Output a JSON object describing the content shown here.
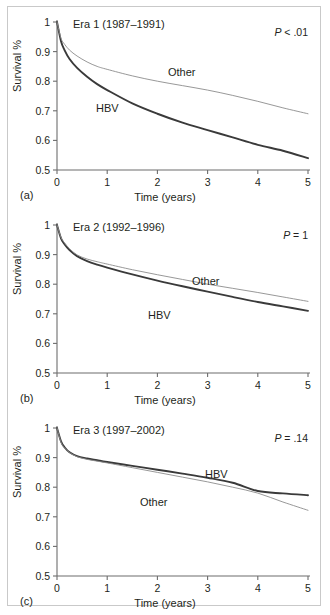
{
  "figure": {
    "panels": [
      {
        "letter": "(a)",
        "title": "Era 1 (1987–1991)",
        "pvalue_p": "P",
        "pvalue_rest": " < .01",
        "hbv_label": "HBV",
        "other_label": "Other"
      },
      {
        "letter": "(b)",
        "title": "Era 2 (1992–1996)",
        "pvalue_p": "P",
        "pvalue_rest": " = 1",
        "hbv_label": "HBV",
        "other_label": "Other"
      },
      {
        "letter": "(c)",
        "title": "Era 3 (1997–2002)",
        "pvalue_p": "P",
        "pvalue_rest": " = .14",
        "hbv_label": "HBV",
        "other_label": "Other"
      }
    ],
    "axis": {
      "xlabel": "Time (years)",
      "ylabel": "Survival %",
      "xticks": [
        "0",
        "1",
        "2",
        "3",
        "4",
        "5"
      ],
      "yticks": [
        "1",
        "0.9",
        "0.8",
        "0.7",
        "0.6",
        "0.5"
      ]
    },
    "colors": {
      "hbv": "#3a3a3a",
      "other": "#8c8c8c",
      "axis": "#6d6d6d",
      "text": "#231f20",
      "frame": "#c9c9c9",
      "background": "#ffffff"
    }
  },
  "chart_data": [
    {
      "type": "line",
      "title": "Era 1 (1987–1991)",
      "panel": "(a)",
      "annotations": [
        "P < .01"
      ],
      "xlabel": "Time (years)",
      "ylabel": "Survival %",
      "xlim": [
        0,
        5
      ],
      "ylim": [
        0.5,
        1.0
      ],
      "xticks": [
        0,
        1,
        2,
        3,
        4,
        5
      ],
      "yticks": [
        0.5,
        0.6,
        0.7,
        0.8,
        0.9,
        1.0
      ],
      "grid": false,
      "legend": "inline-curve-labels",
      "x": [
        0,
        0.08,
        0.15,
        0.25,
        0.4,
        0.6,
        0.8,
        1.0,
        1.5,
        2.0,
        2.5,
        3.0,
        3.5,
        4.0,
        4.5,
        5.0
      ],
      "series": [
        {
          "name": "HBV",
          "style": "bold",
          "values": [
            1.0,
            0.935,
            0.905,
            0.875,
            0.845,
            0.815,
            0.79,
            0.77,
            0.725,
            0.69,
            0.66,
            0.635,
            0.61,
            0.585,
            0.565,
            0.54
          ]
        },
        {
          "name": "Other",
          "style": "thin",
          "values": [
            1.0,
            0.945,
            0.925,
            0.905,
            0.885,
            0.865,
            0.85,
            0.84,
            0.818,
            0.8,
            0.785,
            0.77,
            0.752,
            0.732,
            0.71,
            0.69
          ]
        }
      ]
    },
    {
      "type": "line",
      "title": "Era 2 (1992–1996)",
      "panel": "(b)",
      "annotations": [
        "P = 1"
      ],
      "xlabel": "Time (years)",
      "ylabel": "Survival %",
      "xlim": [
        0,
        5
      ],
      "ylim": [
        0.5,
        1.0
      ],
      "xticks": [
        0,
        1,
        2,
        3,
        4,
        5
      ],
      "yticks": [
        0.5,
        0.6,
        0.7,
        0.8,
        0.9,
        1.0
      ],
      "grid": false,
      "legend": "inline-curve-labels",
      "x": [
        0,
        0.08,
        0.15,
        0.25,
        0.4,
        0.6,
        0.8,
        1.0,
        1.5,
        2.0,
        2.5,
        3.0,
        3.5,
        4.0,
        4.5,
        5.0
      ],
      "series": [
        {
          "name": "HBV",
          "style": "bold",
          "values": [
            1.0,
            0.955,
            0.935,
            0.915,
            0.895,
            0.878,
            0.866,
            0.856,
            0.833,
            0.812,
            0.793,
            0.775,
            0.757,
            0.74,
            0.725,
            0.71
          ]
        },
        {
          "name": "Other",
          "style": "thin",
          "values": [
            1.0,
            0.958,
            0.94,
            0.92,
            0.899,
            0.885,
            0.876,
            0.868,
            0.849,
            0.832,
            0.816,
            0.8,
            0.786,
            0.772,
            0.757,
            0.742
          ]
        }
      ]
    },
    {
      "type": "line",
      "title": "Era 3 (1997–2002)",
      "panel": "(c)",
      "annotations": [
        "P = .14"
      ],
      "xlabel": "Time (years)",
      "ylabel": "Survival %",
      "xlim": [
        0,
        5
      ],
      "ylim": [
        0.5,
        1.0
      ],
      "xticks": [
        0,
        1,
        2,
        3,
        4,
        5
      ],
      "yticks": [
        0.5,
        0.6,
        0.7,
        0.8,
        0.9,
        1.0
      ],
      "grid": false,
      "legend": "inline-curve-labels",
      "x": [
        0,
        0.08,
        0.15,
        0.25,
        0.4,
        0.6,
        0.8,
        1.0,
        1.5,
        2.0,
        2.5,
        3.0,
        3.5,
        4.0,
        4.5,
        5.0
      ],
      "series": [
        {
          "name": "HBV",
          "style": "bold",
          "values": [
            1.0,
            0.955,
            0.935,
            0.918,
            0.905,
            0.897,
            0.891,
            0.885,
            0.872,
            0.859,
            0.846,
            0.832,
            0.815,
            0.787,
            0.779,
            0.773
          ]
        },
        {
          "name": "Other",
          "style": "thin",
          "values": [
            1.0,
            0.952,
            0.933,
            0.917,
            0.903,
            0.894,
            0.888,
            0.882,
            0.866,
            0.85,
            0.834,
            0.818,
            0.8,
            0.78,
            0.75,
            0.722
          ]
        }
      ]
    }
  ]
}
